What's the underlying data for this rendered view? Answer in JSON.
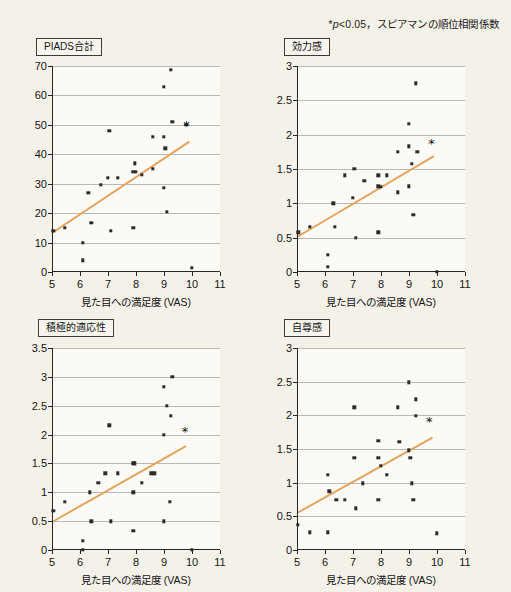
{
  "figure": {
    "significance_note_prefix": "*",
    "significance_note_italic": "p",
    "significance_note_rest": "<0.05，スピアマンの順位相関係数",
    "significance_note_full": "*p<0.05，スピアマンの順位相関係数",
    "background_color": "#f4f1e9",
    "trend_color": "#e3a55e",
    "marker_color": "#2b2b2b",
    "grid_color": "#b9b9b9",
    "axis_color": "#262626"
  },
  "chart_data": [
    {
      "id": "piads-total",
      "type": "scatter",
      "title": "PIADS合計",
      "xlabel": "見た目への満足度 (VAS)",
      "ylabel": "",
      "xlim": [
        5,
        11
      ],
      "ylim": [
        0,
        70
      ],
      "xticks": [
        5,
        6,
        7,
        8,
        9,
        10,
        11
      ],
      "xtick_labels": [
        "5",
        "6",
        "7",
        "8",
        "9",
        "10",
        "11"
      ],
      "yticks": [
        0,
        10,
        20,
        30,
        40,
        50,
        60,
        70
      ],
      "ytick_labels": [
        "0",
        "10",
        "20",
        "30",
        "40",
        "50",
        "60",
        "70"
      ],
      "grid": true,
      "points": [
        [
          5.05,
          14.0
        ],
        [
          5.45,
          15.0
        ],
        [
          6.1,
          10.0
        ],
        [
          6.1,
          4.0
        ],
        [
          6.3,
          27.0
        ],
        [
          6.4,
          16.8
        ],
        [
          6.75,
          29.7
        ],
        [
          7.0,
          32.0
        ],
        [
          7.05,
          48.0
        ],
        [
          7.1,
          14.0
        ],
        [
          7.35,
          32.0
        ],
        [
          7.9,
          15.0
        ],
        [
          7.9,
          34.0
        ],
        [
          7.95,
          37.0
        ],
        [
          8.0,
          34.0
        ],
        [
          8.2,
          33.0
        ],
        [
          8.6,
          46.0
        ],
        [
          8.6,
          35.0
        ],
        [
          9.0,
          46.0
        ],
        [
          9.0,
          63.0
        ],
        [
          9.0,
          28.7
        ],
        [
          9.05,
          42.0
        ],
        [
          9.1,
          20.5
        ],
        [
          9.25,
          68.8
        ],
        [
          9.3,
          51.0
        ],
        [
          9.8,
          50.0
        ],
        [
          10.0,
          1.5
        ]
      ],
      "trend": {
        "x1": 5.0,
        "y1": 13.5,
        "x2": 9.9,
        "y2": 44.5
      },
      "annotation": {
        "label": "*",
        "x": 9.8,
        "y": 50.0
      }
    },
    {
      "id": "efficacy",
      "type": "scatter",
      "title": "効力感",
      "xlabel": "見た目への満足度 (VAS)",
      "ylabel": "",
      "xlim": [
        5,
        11
      ],
      "ylim": [
        0,
        3
      ],
      "xticks": [
        5,
        6,
        7,
        8,
        9,
        10,
        11
      ],
      "xtick_labels": [
        "5",
        "6",
        "7",
        "8",
        "9",
        "10",
        "11"
      ],
      "yticks": [
        0,
        0.5,
        1,
        1.5,
        2,
        2.5,
        3
      ],
      "ytick_labels": [
        "0",
        "0.5",
        "1",
        "1.5",
        "2",
        "2.5",
        "3"
      ],
      "grid": true,
      "points": [
        [
          5.05,
          0.58
        ],
        [
          5.45,
          0.66
        ],
        [
          6.1,
          0.25
        ],
        [
          6.1,
          0.08
        ],
        [
          6.3,
          1.0
        ],
        [
          6.35,
          0.66
        ],
        [
          6.7,
          1.41
        ],
        [
          7.0,
          1.08
        ],
        [
          7.05,
          1.5
        ],
        [
          7.1,
          0.5
        ],
        [
          7.4,
          1.33
        ],
        [
          7.9,
          0.58
        ],
        [
          7.9,
          1.41
        ],
        [
          7.9,
          1.25
        ],
        [
          8.0,
          1.24
        ],
        [
          8.2,
          1.41
        ],
        [
          8.6,
          1.75
        ],
        [
          8.6,
          1.16
        ],
        [
          9.0,
          1.83
        ],
        [
          9.0,
          2.16
        ],
        [
          9.0,
          1.25
        ],
        [
          9.1,
          1.58
        ],
        [
          9.15,
          0.83
        ],
        [
          9.25,
          2.75
        ],
        [
          9.3,
          1.75
        ],
        [
          10.0,
          0.0
        ]
      ],
      "trend": {
        "x1": 5.0,
        "y1": 0.52,
        "x2": 9.9,
        "y2": 1.7
      },
      "annotation": {
        "label": "*",
        "x": 9.8,
        "y": 1.88
      }
    },
    {
      "id": "positive-adaptability",
      "type": "scatter",
      "title": "積極的適応性",
      "xlabel": "見た目への満足度 (VAS)",
      "ylabel": "",
      "xlim": [
        5,
        11
      ],
      "ylim": [
        0,
        3.5
      ],
      "xticks": [
        5,
        6,
        7,
        8,
        9,
        10,
        11
      ],
      "xtick_labels": [
        "5",
        "6",
        "7",
        "8",
        "9",
        "10",
        "11"
      ],
      "yticks": [
        0,
        0.5,
        1,
        1.5,
        2,
        2.5,
        3,
        3.5
      ],
      "ytick_labels": [
        "0",
        "0.5",
        "1",
        "1.5",
        "2",
        "2.5",
        "3",
        "3.5"
      ],
      "grid": true,
      "points": [
        [
          5.05,
          0.68
        ],
        [
          5.45,
          0.84
        ],
        [
          6.1,
          0.0
        ],
        [
          6.1,
          0.16
        ],
        [
          6.35,
          1.0
        ],
        [
          6.4,
          0.5
        ],
        [
          6.65,
          1.16
        ],
        [
          6.9,
          1.33
        ],
        [
          7.05,
          2.16
        ],
        [
          7.1,
          0.5
        ],
        [
          7.35,
          1.33
        ],
        [
          7.9,
          1.5
        ],
        [
          7.95,
          1.5
        ],
        [
          7.9,
          1.0
        ],
        [
          7.9,
          0.33
        ],
        [
          8.2,
          1.16
        ],
        [
          8.55,
          1.33
        ],
        [
          8.65,
          1.33
        ],
        [
          9.0,
          2.0
        ],
        [
          9.0,
          2.83
        ],
        [
          9.0,
          0.5
        ],
        [
          9.1,
          2.5
        ],
        [
          9.2,
          0.84
        ],
        [
          9.25,
          2.33
        ],
        [
          9.3,
          3.0
        ],
        [
          10.0,
          0.0
        ]
      ],
      "trend": {
        "x1": 5.0,
        "y1": 0.5,
        "x2": 9.8,
        "y2": 1.82
      },
      "annotation": {
        "label": "*",
        "x": 9.75,
        "y": 2.06
      }
    },
    {
      "id": "self-esteem",
      "type": "scatter",
      "title": "自尊感",
      "xlabel": "見た目への満足度 (VAS)",
      "ylabel": "",
      "xlim": [
        5,
        11
      ],
      "ylim": [
        0,
        3
      ],
      "xticks": [
        5,
        6,
        7,
        8,
        9,
        10,
        11
      ],
      "xtick_labels": [
        "5",
        "6",
        "7",
        "8",
        "9",
        "10",
        "11"
      ],
      "yticks": [
        0,
        0.5,
        1,
        1.5,
        2,
        2.5,
        3
      ],
      "ytick_labels": [
        "0",
        "0.5",
        "1",
        "1.5",
        "2",
        "2.5",
        "3"
      ],
      "grid": true,
      "points": [
        [
          5.02,
          0.37
        ],
        [
          5.45,
          0.26
        ],
        [
          6.1,
          0.26
        ],
        [
          6.1,
          1.12
        ],
        [
          6.15,
          0.87
        ],
        [
          6.4,
          0.75
        ],
        [
          6.7,
          0.75
        ],
        [
          7.05,
          2.12
        ],
        [
          7.05,
          1.37
        ],
        [
          7.1,
          0.62
        ],
        [
          7.35,
          0.99
        ],
        [
          7.9,
          1.62
        ],
        [
          7.9,
          1.37
        ],
        [
          7.9,
          0.75
        ],
        [
          8.0,
          1.25
        ],
        [
          8.2,
          1.12
        ],
        [
          8.6,
          2.12
        ],
        [
          8.65,
          1.61
        ],
        [
          9.0,
          2.49
        ],
        [
          9.0,
          1.48
        ],
        [
          9.05,
          1.37
        ],
        [
          9.1,
          0.99
        ],
        [
          9.15,
          0.75
        ],
        [
          9.25,
          2.24
        ],
        [
          9.25,
          1.99
        ],
        [
          10.0,
          0.25
        ]
      ],
      "trend": {
        "x1": 5.0,
        "y1": 0.57,
        "x2": 9.85,
        "y2": 1.69
      },
      "annotation": {
        "label": "*",
        "x": 9.72,
        "y": 1.91
      }
    }
  ]
}
